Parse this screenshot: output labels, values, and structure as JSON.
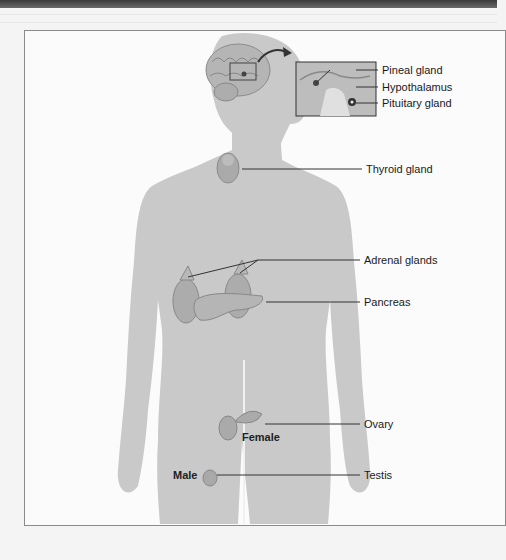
{
  "figure": {
    "labels": {
      "pineal": "Pineal gland",
      "hypothalamus": "Hypothalamus",
      "pituitary": "Pituitary gland",
      "thyroid": "Thyroid gland",
      "adrenal": "Adrenal glands",
      "pancreas": "Pancreas",
      "ovary": "Ovary",
      "testis": "Testis"
    },
    "sex_labels": {
      "female": "Female",
      "male": "Male"
    },
    "colors": {
      "silhouette": "#c9c9c9",
      "organ": "#a9a9a9",
      "leader_line": "#333333",
      "frame_border": "#8a8a8a"
    }
  }
}
